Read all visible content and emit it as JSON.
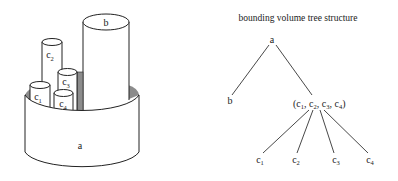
{
  "illustration": {
    "outer_volume_label": "a",
    "tall_volume_label": "b",
    "small_volumes": [
      {
        "base": "c",
        "sub": "1"
      },
      {
        "base": "c",
        "sub": "2"
      },
      {
        "base": "c",
        "sub": "3"
      },
      {
        "base": "c",
        "sub": "4"
      }
    ],
    "shadow_color": "#8c8c8c"
  },
  "tree": {
    "title": "bounding volume tree structure",
    "root": {
      "label": "a"
    },
    "left_child": {
      "label": "b"
    },
    "group_node": {
      "open": "(",
      "items": [
        {
          "base": "c",
          "sub": "1"
        },
        {
          "base": "c",
          "sub": "2"
        },
        {
          "base": "c",
          "sub": "3"
        },
        {
          "base": "c",
          "sub": "4"
        }
      ],
      "separator": ", ",
      "close": ")"
    },
    "leaves": [
      {
        "base": "c",
        "sub": "1"
      },
      {
        "base": "c",
        "sub": "2"
      },
      {
        "base": "c",
        "sub": "3"
      },
      {
        "base": "c",
        "sub": "4"
      }
    ]
  }
}
